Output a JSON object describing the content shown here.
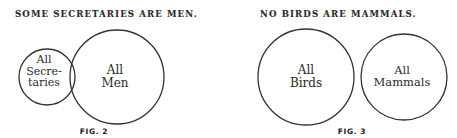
{
  "figures": [
    {
      "heading": "SOME SECRETARIES ARE MEN.",
      "caption": "FIG. 2",
      "circles": [
        {
          "line1": "All",
          "line2": "Secre-",
          "line3": "taries",
          "cx": 47,
          "cy": 77,
          "r": 28
        },
        {
          "line1": "All",
          "line2": "Men",
          "cx": 117,
          "cy": 77,
          "r": 47
        }
      ]
    },
    {
      "heading": "NO BIRDS ARE MAMMALS.",
      "caption": "FIG. 3",
      "circles": [
        {
          "line1": "All",
          "line2": "Birds",
          "cx": 306,
          "cy": 77,
          "r": 48
        },
        {
          "line1": "All",
          "line2": "Mammals",
          "cx": 404,
          "cy": 77,
          "r": 43
        }
      ]
    }
  ],
  "colors": {
    "stroke": "#333333",
    "text": "#2b2b2b",
    "background": "#ffffff"
  }
}
